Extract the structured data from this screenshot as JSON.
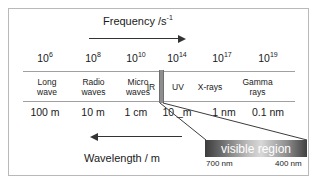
{
  "figure": {
    "frequency_axis": {
      "title_text": "Frequency /s",
      "title_exponent": "-1",
      "direction": "right"
    },
    "wavelength_axis": {
      "title": "Wavelength / m",
      "direction": "left"
    },
    "frequency_ticks": [
      {
        "mantissa": "10",
        "exponent": "6",
        "x": 45
      },
      {
        "mantissa": "10",
        "exponent": "8",
        "x": 93
      },
      {
        "mantissa": "10",
        "exponent": "10",
        "x": 136
      },
      {
        "mantissa": "10",
        "exponent": "14",
        "x": 177
      },
      {
        "mantissa": "10",
        "exponent": "17",
        "x": 222
      },
      {
        "mantissa": "10",
        "exponent": "19",
        "x": 268
      }
    ],
    "bands": [
      {
        "name": "long-wave",
        "line1": "Long",
        "line2": "wave",
        "left": 0,
        "width": 48
      },
      {
        "name": "radio-waves",
        "line1": "Radio",
        "line2": "waves",
        "left": 48,
        "width": 45
      },
      {
        "name": "micro-waves",
        "line1": "Micro",
        "line2": "waves",
        "left": 93,
        "width": 44
      },
      {
        "name": "infrared",
        "line1": "IR",
        "line2": "",
        "left": 118,
        "width": 20
      },
      {
        "name": "ultraviolet",
        "line1": "UV",
        "line2": "",
        "left": 143,
        "width": 24
      },
      {
        "name": "x-rays",
        "line1": "X-rays",
        "line2": "",
        "left": 167,
        "width": 40
      },
      {
        "name": "gamma-rays",
        "line1": "Gamma",
        "line2": "rays",
        "left": 207,
        "width": 55
      }
    ],
    "wavelength_ticks": [
      {
        "label": "100 m",
        "x": 45
      },
      {
        "label": "10 m",
        "x": 93
      },
      {
        "label": "1 cm",
        "x": 136
      },
      {
        "label": "10 _m",
        "x": 177
      },
      {
        "label": "1 nm",
        "x": 224
      },
      {
        "label": "0.1 nm",
        "x": 268
      }
    ],
    "visible_region": {
      "label": "visible region",
      "long_wavelength": "700 nm",
      "short_wavelength": "400 nm"
    },
    "colors": {
      "frame": "#b9b9b9",
      "bar_rule": "#a0a0a0",
      "text": "#1a1a1a",
      "arrow": "#333333",
      "sliver": "#8e8e8e",
      "callout_text": "#ffffff"
    }
  }
}
